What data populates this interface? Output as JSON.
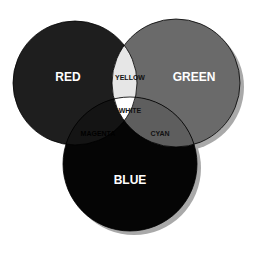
{
  "diagram": {
    "type": "venn",
    "title": "",
    "colors": {
      "red": "#1e1e1e",
      "green": "#6a6a6a",
      "blue": "#050505",
      "yellow": "#e6e6e6",
      "magenta": "#141414",
      "cyan": "#5e5e5e",
      "white": "#ffffff",
      "shadow": "#a9a9a9",
      "outline": "#000000"
    },
    "sets": [
      {
        "id": "red",
        "label": "RED"
      },
      {
        "id": "green",
        "label": "GREEN"
      },
      {
        "id": "blue",
        "label": "BLUE"
      }
    ],
    "intersections": [
      {
        "sets": [
          "red",
          "green"
        ],
        "label": "YELLOW"
      },
      {
        "sets": [
          "red",
          "blue"
        ],
        "label": "MAGENTA"
      },
      {
        "sets": [
          "green",
          "blue"
        ],
        "label": "CYAN"
      },
      {
        "sets": [
          "red",
          "green",
          "blue"
        ],
        "label": "WHITE"
      }
    ]
  }
}
